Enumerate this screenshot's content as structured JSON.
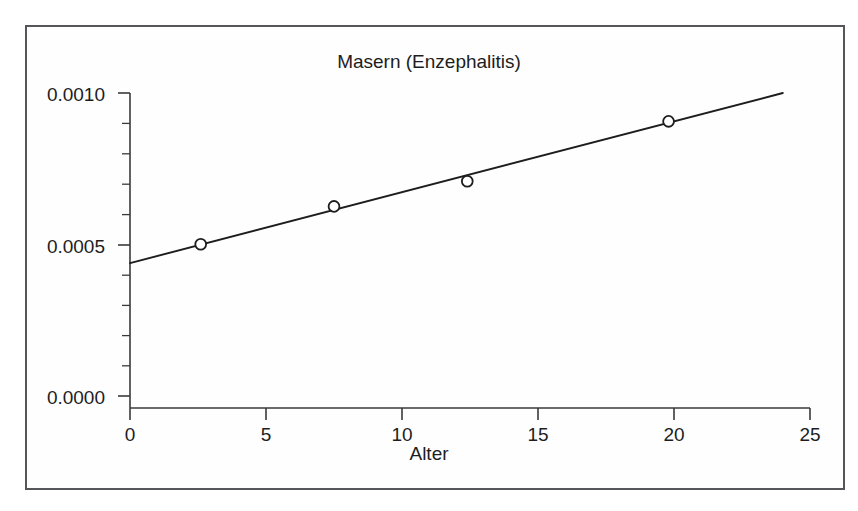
{
  "chart_data": {
    "type": "scatter",
    "title": "Masern (Enzephalitis)",
    "xlabel": "Alter",
    "ylabel": "",
    "xlim": [
      0,
      25
    ],
    "ylim": [
      0.0,
      0.001
    ],
    "grid": false,
    "legend": "none",
    "x_ticks": [
      0,
      5,
      10,
      15,
      20,
      25
    ],
    "x_tick_labels": [
      "0",
      "5",
      "10",
      "15",
      "20",
      "25"
    ],
    "y_ticks": [
      0.0,
      0.0005,
      0.001
    ],
    "y_tick_labels": [
      "0.0000",
      "0.0005",
      "0.0010"
    ],
    "y_minor_tick_count": 10,
    "marker": "open-circle",
    "points": [
      {
        "x": 2.6,
        "y": 0.00052
      },
      {
        "x": 7.5,
        "y": 0.00064
      },
      {
        "x": 12.4,
        "y": 0.00072
      },
      {
        "x": 19.8,
        "y": 0.00091
      }
    ],
    "series": [
      {
        "name": "Beobachtungen",
        "type": "scatter",
        "x": [
          2.6,
          7.5,
          12.4,
          19.8
        ],
        "values": [
          0.00052,
          0.00064,
          0.00072,
          0.00091
        ]
      },
      {
        "name": "Regressionsgerade",
        "type": "line",
        "x": [
          0,
          24
        ],
        "values": [
          0.00046,
          0.001
        ]
      }
    ],
    "fit_line": {
      "x_start": 0,
      "y_start": 0.00046,
      "x_end": 24,
      "y_end": 0.001
    },
    "colors": {
      "line": "#1d1d1f",
      "marker_stroke": "#1d1d1f",
      "marker_fill": "#ffffff",
      "axis": "#3a3a3c",
      "frame": "#55565a",
      "background": "#ffffff",
      "text": "#1d1d1f"
    }
  },
  "axis_labels": {
    "y": [
      "0.0010",
      "0.0005",
      "0.0000"
    ],
    "x": [
      "0",
      "5",
      "10",
      "15",
      "20",
      "25"
    ]
  },
  "titles": {
    "chart": "Masern (Enzephalitis)",
    "x_axis": "Alter"
  }
}
